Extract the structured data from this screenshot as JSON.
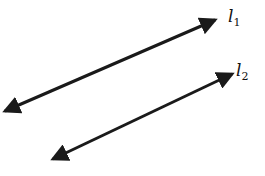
{
  "diagram": {
    "type": "parallel-lines",
    "lines": [
      {
        "id": "l1",
        "label": "l",
        "subscript": "1",
        "start": [
          5,
          111
        ],
        "end": [
          215,
          20
        ],
        "label_pos": [
          228,
          22
        ],
        "arrows": "both"
      },
      {
        "id": "l2",
        "label": "l",
        "subscript": "2",
        "start": [
          53,
          159
        ],
        "end": [
          232,
          74
        ],
        "label_pos": [
          236,
          76
        ],
        "arrows": "both"
      }
    ],
    "stroke_color": "#1a1a1a",
    "background": "#ffffff"
  }
}
